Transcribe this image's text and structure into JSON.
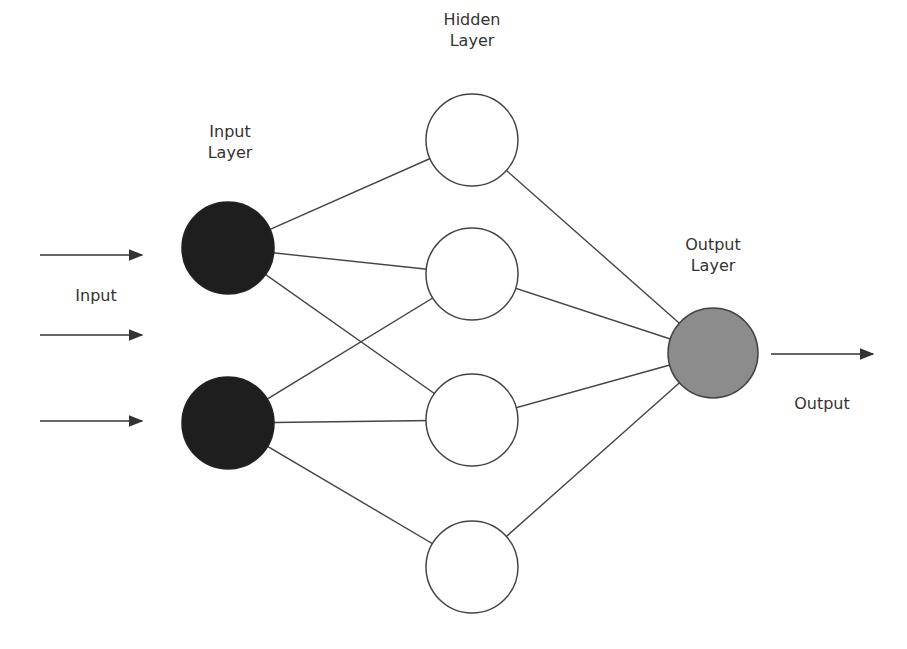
{
  "labels": {
    "input_layer_1": "Input",
    "input_layer_2": "Layer",
    "hidden_layer_1": "Hidden",
    "hidden_layer_2": "Layer",
    "output_layer_1": "Output",
    "output_layer_2": "Layer",
    "input": "Input",
    "output": "Output"
  },
  "colors": {
    "input_node": "#1e1e1e",
    "hidden_node": "#ffffff",
    "output_node": "#8c8c8c",
    "line": "#444444"
  },
  "nodes": {
    "input": [
      {
        "x": 228,
        "y": 248
      },
      {
        "x": 228,
        "y": 423
      }
    ],
    "hidden": [
      {
        "x": 472,
        "y": 140
      },
      {
        "x": 472,
        "y": 274
      },
      {
        "x": 472,
        "y": 420
      },
      {
        "x": 472,
        "y": 567
      }
    ],
    "output": [
      {
        "x": 713,
        "y": 353
      }
    ]
  }
}
